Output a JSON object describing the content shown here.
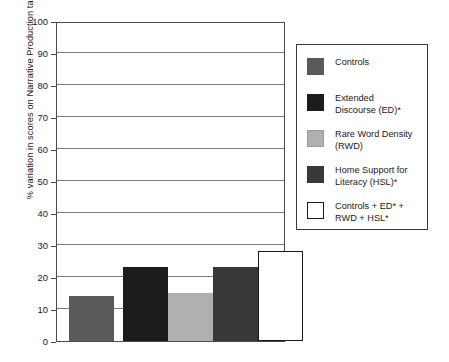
{
  "chart_data": {
    "type": "bar",
    "title": "",
    "xlabel": "",
    "ylabel": "% variation in scores on Narrative Production task",
    "ylim": [
      0,
      100
    ],
    "yticks": [
      0,
      10,
      20,
      30,
      40,
      50,
      60,
      70,
      80,
      90,
      100
    ],
    "ytick_labels": [
      "0",
      "10",
      "20",
      "30",
      "40",
      "50",
      "60",
      "70",
      "80",
      "90",
      "100"
    ],
    "grid": true,
    "grid_axis": "y",
    "legend_position": "right-outside",
    "categories": [
      "Controls",
      "Extended Discourse (ED)*",
      "Rare Word Density (RWD)",
      "Home Support for Literacy (HSL)*",
      "Controls + ED* + RWD + HSL*"
    ],
    "values": [
      14,
      23,
      15,
      23,
      28
    ],
    "colors": [
      "#5a5a5a",
      "#1c1c1c",
      "#b0b0b0",
      "#383838",
      "#ffffff"
    ],
    "edge_colors": [
      "#5a5a5a",
      "#1c1c1c",
      "#b0b0b0",
      "#383838",
      "#1a1a1a"
    ]
  },
  "axis": {
    "y_title": "% variation in scores on Narrative Production task",
    "ticks": [
      {
        "label": "100",
        "value": 100
      },
      {
        "label": "90",
        "value": 90
      },
      {
        "label": "80",
        "value": 80
      },
      {
        "label": "70",
        "value": 70
      },
      {
        "label": "60",
        "value": 60
      },
      {
        "label": "50",
        "value": 50
      },
      {
        "label": "40",
        "value": 40
      },
      {
        "label": "30",
        "value": 30
      },
      {
        "label": "20",
        "value": 20
      },
      {
        "label": "10",
        "value": 10
      },
      {
        "label": "0",
        "value": 0
      }
    ]
  },
  "legend": {
    "items": [
      {
        "label": "Controls",
        "color": "#5a5a5a",
        "border": "#5a5a5a"
      },
      {
        "label": "Extended\nDiscourse (ED)*",
        "color": "#1c1c1c",
        "border": "#1c1c1c"
      },
      {
        "label": "Rare Word Density\n(RWD)",
        "color": "#b0b0b0",
        "border": "#9a9a9a"
      },
      {
        "label": "Home Support for\nLiteracy (HSL)*",
        "color": "#383838",
        "border": "#383838"
      },
      {
        "label": "Controls + ED* +\nRWD + HSL*",
        "color": "#ffffff",
        "border": "#1a1a1a"
      }
    ]
  }
}
